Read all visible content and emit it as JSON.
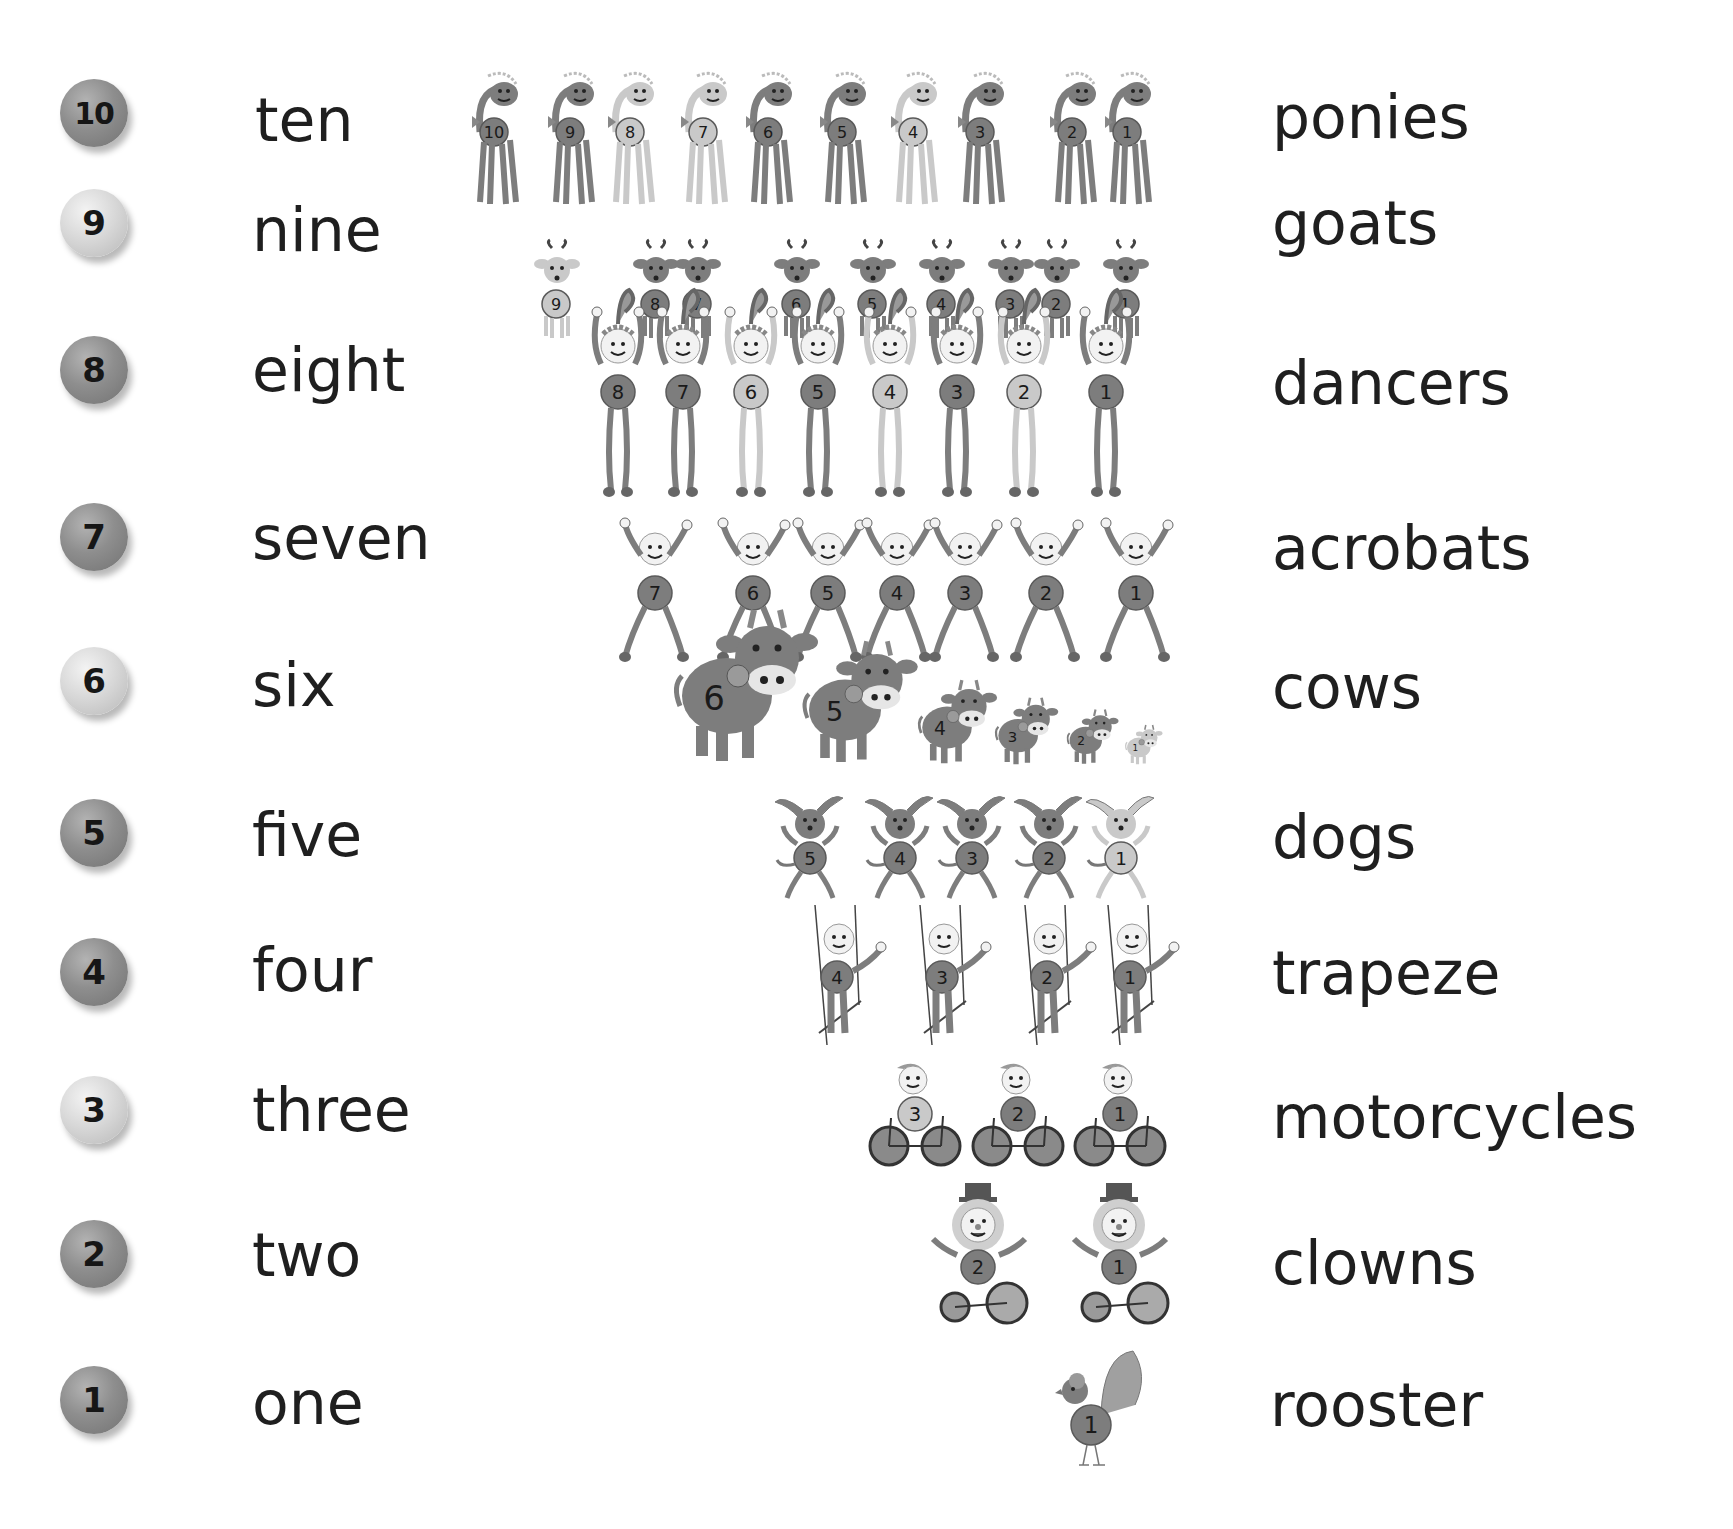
{
  "rows": [
    {
      "number": "10",
      "word": "ten",
      "noun": "ponies",
      "ball": "dark",
      "figure": "pony",
      "items": [
        "10",
        "9",
        "8",
        "7",
        "6",
        "5",
        "4",
        "3",
        "2",
        "1"
      ]
    },
    {
      "number": "9",
      "word": "nine",
      "noun": "goats",
      "ball": "light",
      "figure": "goat",
      "items": [
        "9",
        "8",
        "7",
        "6",
        "5",
        "4",
        "3",
        "2",
        "1"
      ]
    },
    {
      "number": "8",
      "word": "eight",
      "noun": "dancers",
      "ball": "dark",
      "figure": "dancer",
      "items": [
        "8",
        "7",
        "6",
        "5",
        "4",
        "3",
        "2",
        "1"
      ]
    },
    {
      "number": "7",
      "word": "seven",
      "noun": "acrobats",
      "ball": "dark",
      "figure": "acrobat",
      "items": [
        "7",
        "6",
        "5",
        "4",
        "3",
        "2",
        "1"
      ]
    },
    {
      "number": "6",
      "word": "six",
      "noun": "cows",
      "ball": "light",
      "figure": "cow",
      "items": [
        "6",
        "5",
        "4",
        "3",
        "2",
        "1"
      ]
    },
    {
      "number": "5",
      "word": "five",
      "noun": "dogs",
      "ball": "dark",
      "figure": "dog",
      "items": [
        "5",
        "4",
        "3",
        "2",
        "1"
      ]
    },
    {
      "number": "4",
      "word": "four",
      "noun": "trapeze",
      "ball": "dark",
      "figure": "trapeze-artist",
      "items": [
        "4",
        "3",
        "2",
        "1"
      ]
    },
    {
      "number": "3",
      "word": "three",
      "noun": "motorcycles",
      "ball": "light",
      "figure": "motorcycle",
      "items": [
        "3",
        "2",
        "1"
      ]
    },
    {
      "number": "2",
      "word": "two",
      "noun": "clowns",
      "ball": "dark",
      "figure": "clown",
      "items": [
        "2",
        "1"
      ]
    },
    {
      "number": "1",
      "word": "one",
      "noun": "rooster",
      "ball": "dark",
      "figure": "rooster",
      "items": [
        "1"
      ]
    }
  ],
  "colors": {
    "text": "#1f1f1f",
    "ball_dark": "#8e8e8e",
    "ball_light": "#d6d6d6",
    "figure_dark": "#7a7a7a",
    "figure_light": "#c8c8c8"
  }
}
